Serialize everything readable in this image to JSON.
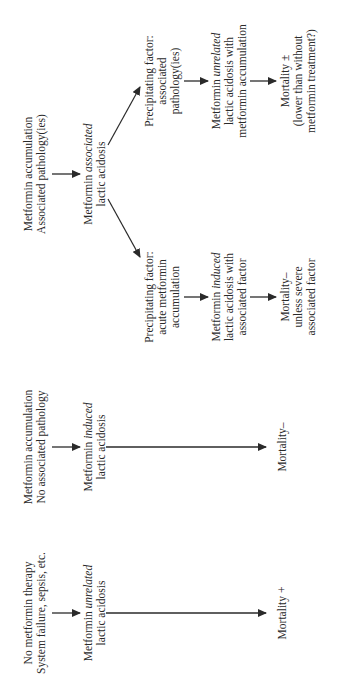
{
  "figure": {
    "orientation": "rotated-90-ccw",
    "columns": [
      {
        "id": "col-unrelated",
        "context": [
          "No metformin therapy",
          "System failure, sepsis, etc."
        ],
        "outcome_node": {
          "prefix": "Metformin ",
          "emphasis": "unrelated",
          "suffix": "",
          "line2": "lactic acidosis"
        },
        "mortality": "Mortality +"
      },
      {
        "id": "col-induced",
        "context": [
          "Metformin accumulation",
          "No associated pathology"
        ],
        "outcome_node": {
          "prefix": "Metformin ",
          "emphasis": "induced",
          "suffix": "",
          "line2": "lactic acidosis"
        },
        "mortality": "Mortality–"
      },
      {
        "id": "col-associated",
        "context": [
          "Metformin accumulation",
          "Associated pathology(ies)"
        ],
        "outcome_node": {
          "prefix": "Metformin ",
          "emphasis": "associated",
          "suffix": "",
          "line2": "lactic acidosis"
        },
        "branches": [
          {
            "id": "branch-acute",
            "precipitating": [
              "Precipitating factor:",
              "acute metformin",
              "accumulation"
            ],
            "result": {
              "prefix": "Metformin ",
              "emphasis": "induced",
              "line2": "lactic acidosis with",
              "line3": "associated factor"
            },
            "mortality": [
              "Mortality–",
              "unless severe",
              "associated factor"
            ]
          },
          {
            "id": "branch-pathology",
            "precipitating": [
              "Precipitating factor:",
              "associated",
              "pathology(ies)"
            ],
            "result": {
              "prefix": "Metformin ",
              "emphasis": "unrelated",
              "line2": "lactic acidosis with",
              "line3": "metformin accumulation"
            },
            "mortality": [
              "Mortality ±",
              "(lower than without",
              "metformin treatment?)"
            ]
          }
        ]
      }
    ]
  },
  "colors": {
    "ink": "#2a2a2a",
    "background": "#ffffff"
  }
}
